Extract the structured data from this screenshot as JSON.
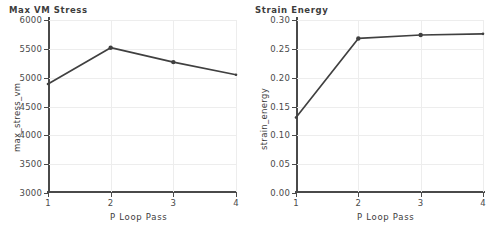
{
  "figure": {
    "background": "#ffffff",
    "series_color": "#404040",
    "axis_color": "#4a4a4a",
    "grid_color": "#ededed"
  },
  "chart_data": [
    {
      "type": "line",
      "title": "Max VM Stress",
      "xlabel": "P Loop Pass",
      "ylabel": "max_stress_vm",
      "x": [
        1,
        2,
        3,
        4
      ],
      "categories": [
        "1",
        "2",
        "3",
        "4"
      ],
      "values": [
        4890,
        5520,
        5270,
        5050
      ],
      "xlim": [
        1,
        4
      ],
      "ylim": [
        3000,
        6000
      ],
      "yticks": [
        3000,
        3500,
        4000,
        4500,
        5000,
        5500,
        6000
      ],
      "ytick_labels": [
        "3000",
        "3500",
        "4000",
        "4500",
        "5000",
        "5500",
        "6000"
      ],
      "xticks": [
        1,
        2,
        3,
        4
      ],
      "xtick_labels": [
        "1",
        "2",
        "3",
        "4"
      ],
      "grid": true,
      "legend": null,
      "marker": "circle"
    },
    {
      "type": "line",
      "title": "Strain Energy",
      "xlabel": "P Loop Pass",
      "ylabel": "strain_energy",
      "x": [
        1,
        2,
        3,
        4
      ],
      "categories": [
        "1",
        "2",
        "3",
        "4"
      ],
      "values": [
        0.131,
        0.268,
        0.274,
        0.276
      ],
      "xlim": [
        1,
        4
      ],
      "ylim": [
        0.0,
        0.3
      ],
      "yticks": [
        0.0,
        0.05,
        0.1,
        0.15,
        0.2,
        0.25,
        0.3
      ],
      "ytick_labels": [
        "0.00",
        "0.05",
        "0.10",
        "0.15",
        "0.20",
        "0.25",
        "0.30"
      ],
      "xticks": [
        1,
        2,
        3,
        4
      ],
      "xtick_labels": [
        "1",
        "2",
        "3",
        "4"
      ],
      "grid": true,
      "legend": null,
      "marker": "circle"
    }
  ]
}
